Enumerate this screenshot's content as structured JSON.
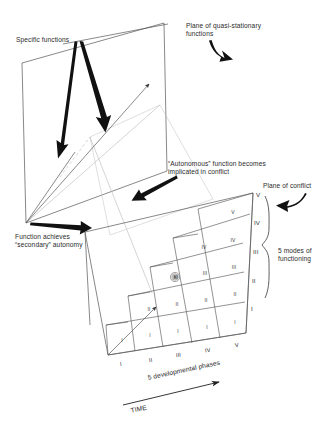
{
  "figure": {
    "type": "conceptual-3d-diagram",
    "background_color": "#ffffff",
    "line_color": "#333333",
    "faint_line_color": "#b9b9b9",
    "text_color": "#2b2b2b"
  },
  "callouts": {
    "specific_functions": "Specific functions",
    "plane_quasi_stationary": "Plane of quasi-stationary\nfunctions",
    "autonomous_conflict": "“Autonomous” function becomes\nimplicated in conflict",
    "secondary_autonomy": "Function achieves\n“secondary” autonomy",
    "plane_of_conflict": "Plane of conflict",
    "five_modes": "5 modes of\nfunctioning"
  },
  "axes": {
    "x_caption": "5 developmental phases",
    "x_ticks": [
      "I",
      "II",
      "III",
      "IV",
      "V"
    ],
    "y_caption": "5 modes of functioning",
    "y_ticks": [
      "I",
      "II",
      "III",
      "IV",
      "V"
    ],
    "time_label": "TIME"
  },
  "grid": {
    "description": "Staircase grid of cells on the plane of conflict; each column is a developmental phase, each row a mode of functioning.",
    "columns": [
      {
        "phase": "I",
        "cells": [
          "I"
        ]
      },
      {
        "phase": "II",
        "cells": [
          "I",
          "II"
        ]
      },
      {
        "phase": "III",
        "cells": [
          "I",
          "II",
          "III"
        ]
      },
      {
        "phase": "IV",
        "cells": [
          "I",
          "II",
          "III",
          "IV"
        ]
      },
      {
        "phase": "V",
        "cells": [
          "I",
          "II",
          "III",
          "IV",
          "V"
        ]
      }
    ]
  },
  "marker": {
    "name": "spiral-marker",
    "label": "",
    "phase": "III",
    "mode": "III"
  }
}
